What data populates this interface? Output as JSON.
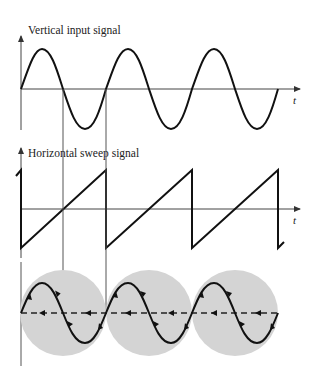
{
  "figure": {
    "panels": [
      {
        "id": "vertical",
        "title": "Vertical input signal",
        "axis_label": "t",
        "waveform": "sine",
        "cycles": 3
      },
      {
        "id": "horizontal",
        "title": "Horizontal sweep signal",
        "axis_label": "t",
        "waveform": "sawtooth",
        "cycles": 3
      },
      {
        "id": "display",
        "title": "",
        "waveform": "sine-trace-on-screen",
        "screens": 3,
        "retrace": "dashed"
      }
    ],
    "colors": {
      "curve": "#111111",
      "screen_fill": "#d4d4d4",
      "axis": "#444444"
    }
  }
}
